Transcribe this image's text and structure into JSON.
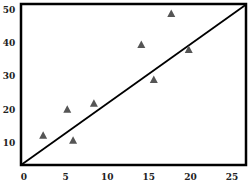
{
  "chart_data": {
    "type": "scatter",
    "title": "",
    "xlabel": "",
    "ylabel": "",
    "xlim": [
      0,
      25
    ],
    "ylim": [
      3,
      52
    ],
    "grid": false,
    "legend": null,
    "x_ticks": [
      0,
      5,
      10,
      15,
      20,
      25
    ],
    "y_ticks": [
      10,
      20,
      30,
      40,
      50
    ],
    "series": [
      {
        "name": "points",
        "marker": "triangle",
        "color": "#555555",
        "points": [
          {
            "x": 2.3,
            "y": 12.3
          },
          {
            "x": 5.2,
            "y": 20.1
          },
          {
            "x": 5.9,
            "y": 10.8
          },
          {
            "x": 8.4,
            "y": 21.9
          },
          {
            "x": 14.1,
            "y": 39.6
          },
          {
            "x": 15.6,
            "y": 29.1
          },
          {
            "x": 17.7,
            "y": 48.9
          },
          {
            "x": 19.8,
            "y": 38.1
          }
        ]
      }
    ],
    "trend_line": {
      "x1": -0.4,
      "y1": 3.3,
      "x2": 26.7,
      "y2": 51.6,
      "color": "#000000"
    }
  }
}
